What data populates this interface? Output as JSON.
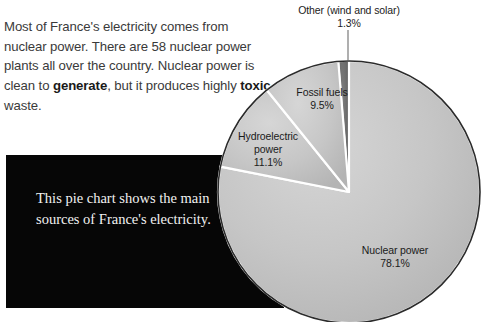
{
  "intro": {
    "segments": [
      {
        "text": "Most of France's electricity comes from nuclear power. There are 58 nuclear power plants all over the country. Nuclear power is clean to ",
        "bold": false
      },
      {
        "text": "generate",
        "bold": true
      },
      {
        "text": ", but it produces highly ",
        "bold": false
      },
      {
        "text": "toxic",
        "bold": true
      },
      {
        "text": " waste.",
        "bold": false
      }
    ],
    "plain": "Most of France's electricity comes from nuclear power. There are 58 nuclear power plants all over the country. Nuclear power is clean to generate, but it produces highly toxic waste."
  },
  "caption": {
    "text": "This pie chart shows the main sources of France's electricity.",
    "background_color": "#060606",
    "text_color": "#f2f2f2"
  },
  "chart_data": {
    "type": "pie",
    "title": "",
    "subtitle": "",
    "xlabel": "",
    "ylabel": "",
    "legend_position": "on-slice",
    "grid": false,
    "unit": "%",
    "categories": [
      "Nuclear power",
      "Hydroelectric power",
      "Fossil fuels",
      "Other (wind and solar)"
    ],
    "values": [
      78.1,
      11.1,
      9.5,
      1.3
    ],
    "slices": [
      {
        "label": "Nuclear power",
        "value": 78.1,
        "value_text": "78.1%",
        "color": "#c2c2c2",
        "label_lines": [
          "Nuclear power",
          "78.1%"
        ]
      },
      {
        "label": "Hydroelectric power",
        "value": 11.1,
        "value_text": "11.1%",
        "color": "#c8c8c8",
        "label_lines": [
          "Hydroelectric",
          "power",
          "11.1%"
        ]
      },
      {
        "label": "Fossil fuels",
        "value": 9.5,
        "value_text": "9.5%",
        "color": "#c6c6c6",
        "label_lines": [
          "Fossil fuels",
          "9.5%"
        ]
      },
      {
        "label": "Other (wind and solar)",
        "value": 1.3,
        "value_text": "1.3%",
        "color": "#6e6e6e",
        "label_lines": [
          "Other (wind and solar)",
          "1.3%"
        ]
      }
    ],
    "slice_separator_color": "#ffffff",
    "outline_color": "#2b2b2b"
  },
  "labels": {
    "other_name": "Other (wind and solar)",
    "other_pct": "1.3%",
    "fossil_name": "Fossil fuels",
    "fossil_pct": "9.5%",
    "hydro_name_line1": "Hydroelectric",
    "hydro_name_line2": "power",
    "hydro_pct": "11.1%",
    "nuclear_name": "Nuclear power",
    "nuclear_pct": "78.1%"
  }
}
